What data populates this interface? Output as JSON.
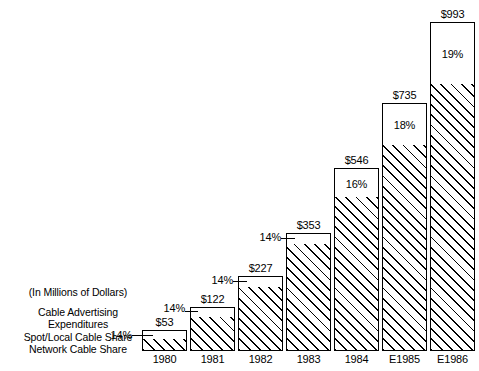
{
  "caption": {
    "units": "(In Millions of Dollars)",
    "lines": [
      "Cable Advertising",
      "Expenditures",
      "Spot/Local Cable Share",
      "Network Cable Share"
    ]
  },
  "chart_data": {
    "type": "bar",
    "title": "Cable Advertising Expenditures",
    "subtitle": "(In Millions of Dollars)",
    "xlabel": "",
    "ylabel": "",
    "ylim": [
      0,
      993
    ],
    "grid": false,
    "legend_position": "left-inline",
    "stacked": true,
    "categories": [
      "1980",
      "1981",
      "1982",
      "1983",
      "1984",
      "E1985",
      "E1986"
    ],
    "totals": [
      53,
      122,
      227,
      353,
      546,
      735,
      993
    ],
    "total_labels": [
      "$53",
      "$122",
      "$227",
      "$353",
      "$546",
      "$735",
      "$993"
    ],
    "series": [
      {
        "name": "Spot/Local Cable Share",
        "fill": "white",
        "share_pct": [
          14,
          14,
          14,
          14,
          16,
          18,
          19
        ],
        "share_labels": [
          "14%",
          "14%",
          "14%",
          "14%",
          "16%",
          "18%",
          "19%"
        ],
        "values": [
          7.4,
          17.1,
          31.8,
          49.4,
          87.4,
          132.3,
          188.7
        ]
      },
      {
        "name": "Network Cable Share",
        "fill": "diagonal-hatch",
        "share_pct": [
          86,
          86,
          86,
          86,
          84,
          82,
          81
        ],
        "values": [
          45.6,
          104.9,
          195.2,
          303.6,
          458.6,
          602.7,
          804.3
        ]
      }
    ],
    "annotations": [
      {
        "category": "1980",
        "text": "14%",
        "placement": "outside-left-leader"
      },
      {
        "category": "1981",
        "text": "14%",
        "placement": "outside-left-leader"
      },
      {
        "category": "1982",
        "text": "14%",
        "placement": "outside-left-leader"
      },
      {
        "category": "1983",
        "text": "14%",
        "placement": "outside-left-leader"
      },
      {
        "category": "1984",
        "text": "16%",
        "placement": "inside-top-segment"
      },
      {
        "category": "E1985",
        "text": "18%",
        "placement": "inside-top-segment"
      },
      {
        "category": "E1986",
        "text": "19%",
        "placement": "inside-top-segment"
      }
    ]
  },
  "bars": [
    {
      "category": "1980",
      "total_label": "$53",
      "pct_label": "14%",
      "pct_placement": "outside",
      "x": 142,
      "width": 45,
      "bar_top": 330,
      "split_y": 340,
      "baseline": 351,
      "label_y": 316,
      "pct_x": 104,
      "pct_y": 329,
      "leader_x": 132,
      "leader_y": 335,
      "leader_w": 11
    },
    {
      "category": "1981",
      "total_label": "$122",
      "pct_label": "14%",
      "pct_placement": "outside",
      "x": 190,
      "width": 45,
      "bar_top": 307,
      "split_y": 318,
      "baseline": 351,
      "label_y": 293,
      "pct_x": 150,
      "pct_y": 302,
      "leader_x": 185,
      "leader_y": 311,
      "leader_w": 8
    },
    {
      "category": "1982",
      "total_label": "$227",
      "pct_label": "14%",
      "pct_placement": "outside",
      "x": 238,
      "width": 45,
      "bar_top": 276,
      "split_y": 288,
      "baseline": 351,
      "label_y": 262,
      "pct_x": 198,
      "pct_y": 274,
      "leader_x": 233,
      "leader_y": 281,
      "leader_w": 9
    },
    {
      "category": "1983",
      "total_label": "$353",
      "pct_label": "14%",
      "pct_placement": "outside",
      "x": 286,
      "width": 45,
      "bar_top": 233,
      "split_y": 245,
      "baseline": 351,
      "label_y": 219,
      "pct_x": 246,
      "pct_y": 231,
      "leader_x": 281,
      "leader_y": 238,
      "leader_w": 9
    },
    {
      "category": "1984",
      "total_label": "$546",
      "pct_label": "16%",
      "pct_placement": "inside",
      "x": 334,
      "width": 45,
      "bar_top": 168,
      "split_y": 198,
      "baseline": 351,
      "label_y": 154
    },
    {
      "category": "E1985",
      "total_label": "$735",
      "pct_label": "18%",
      "pct_placement": "inside",
      "x": 382,
      "width": 45,
      "bar_top": 103,
      "split_y": 146,
      "baseline": 351,
      "label_y": 89
    },
    {
      "category": "E1986",
      "total_label": "$993",
      "pct_label": "19%",
      "pct_placement": "inside",
      "x": 430,
      "width": 45,
      "bar_top": 22,
      "split_y": 85,
      "baseline": 351,
      "label_y": 8
    }
  ]
}
